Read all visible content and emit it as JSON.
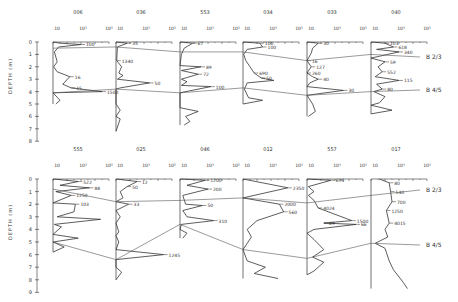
{
  "chart_data": {
    "type": "line",
    "title": "",
    "ylabel": "DEPTH (m)",
    "xlabel": "",
    "x_scale": "log",
    "x_ticks": [
      "10",
      "10³",
      "10⁵"
    ],
    "boundaries": [
      {
        "name": "B 2/3"
      },
      {
        "name": "B 4/5"
      }
    ],
    "rows": [
      {
        "ylim": [
          0,
          8
        ],
        "y_ticks": [
          "0",
          "1",
          "2",
          "3",
          "4",
          "5",
          "6",
          "7",
          "8"
        ],
        "panels": [
          {
            "id": "006",
            "annotations": [
              "100",
              "16",
              "15",
              "1500"
            ],
            "profile": [
              [
                0,
                0.0
              ],
              [
                0.5,
                0.1
              ],
              [
                2,
                0.2
              ],
              [
                0.4,
                0.4
              ],
              [
                0.1,
                0.8
              ],
              [
                0.3,
                1.6
              ],
              [
                0.05,
                2.0
              ],
              [
                0.3,
                2.4
              ],
              [
                1.2,
                2.8
              ],
              [
                0.7,
                3.4
              ],
              [
                1.3,
                3.7
              ],
              [
                3.5,
                4.0
              ],
              [
                0.0,
                4.1
              ],
              [
                0.5,
                4.7
              ],
              [
                0.2,
                5.0
              ]
            ],
            "b23_depth": 0.5,
            "b45_depth": 4.1
          },
          {
            "id": "036",
            "annotations": [
              "35",
              "50",
              "1340"
            ],
            "profile": [
              [
                0,
                0.0
              ],
              [
                0.8,
                0.1
              ],
              [
                0.1,
                0.4
              ],
              [
                0.05,
                1.5
              ],
              [
                0.4,
                2.0
              ],
              [
                0.2,
                2.5
              ],
              [
                0.5,
                2.7
              ],
              [
                0.1,
                3.0
              ],
              [
                2.4,
                3.3
              ],
              [
                0.3,
                3.7
              ],
              [
                0.0,
                3.8
              ],
              [
                0.0,
                5.0
              ],
              [
                0.3,
                5.5
              ],
              [
                0.0,
                6.0
              ],
              [
                0.3,
                6.2
              ],
              [
                0.0,
                7.2
              ]
            ],
            "b23_depth": 0.4,
            "b45_depth": 3.8
          },
          {
            "id": "553",
            "annotations": [
              "67",
              "89",
              "72",
              "100"
            ],
            "profile": [
              [
                0,
                0.0
              ],
              [
                0.9,
                0.1
              ],
              [
                0.3,
                0.5
              ],
              [
                0.1,
                1.0
              ],
              [
                0.0,
                1.9
              ],
              [
                1.5,
                2.0
              ],
              [
                0.1,
                2.3
              ],
              [
                1.3,
                2.6
              ],
              [
                0.1,
                3.0
              ],
              [
                0.5,
                3.2
              ],
              [
                0.1,
                3.5
              ],
              [
                2.2,
                3.6
              ],
              [
                0.0,
                4.1
              ],
              [
                0.0,
                5.3
              ],
              [
                1.3,
                5.6
              ],
              [
                0.4,
                6.0
              ],
              [
                0.7,
                6.4
              ],
              [
                0.3,
                6.7
              ]
            ],
            "b23_depth": 0.8,
            "b45_depth": 4.1
          },
          {
            "id": "034",
            "annotations": [
              "100",
              "100",
              "690",
              "50"
            ],
            "profile": [
              [
                0,
                0.0
              ],
              [
                1.2,
                0.1
              ],
              [
                1.4,
                0.4
              ],
              [
                0.3,
                0.6
              ],
              [
                0.05,
                1.0
              ],
              [
                0.2,
                1.5
              ],
              [
                0.5,
                2.0
              ],
              [
                0.8,
                2.5
              ],
              [
                1.3,
                2.9
              ],
              [
                2.2,
                3.1
              ],
              [
                0.3,
                3.3
              ],
              [
                0.1,
                3.8
              ],
              [
                0.4,
                4.5
              ],
              [
                1.4,
                4.7
              ],
              [
                0.0,
                5.0
              ]
            ],
            "b23_depth": 0.8,
            "b45_depth": 3.7
          },
          {
            "id": "033",
            "annotations": [
              "30",
              "40",
              "30",
              "16",
              "127",
              "260"
            ],
            "profile": [
              [
                0,
                0.0
              ],
              [
                0.8,
                0.1
              ],
              [
                0.4,
                0.5
              ],
              [
                0.3,
                0.9
              ],
              [
                0.0,
                1.5
              ],
              [
                0.3,
                2.0
              ],
              [
                0.0,
                2.5
              ],
              [
                0.4,
                2.8
              ],
              [
                0.8,
                3.0
              ],
              [
                0.2,
                3.3
              ],
              [
                0.0,
                3.6
              ],
              [
                2.6,
                3.9
              ],
              [
                0.0,
                4.3
              ],
              [
                0.4,
                5.0
              ],
              [
                0.6,
                5.6
              ],
              [
                0.1,
                6.0
              ]
            ],
            "b23_depth": 1.5,
            "b45_depth": 4.3
          },
          {
            "id": "040",
            "annotations": [
              "103",
              "618",
              "340",
              "59",
              "552",
              "115",
              "80"
            ],
            "profile": [
              [
                0,
                0.0
              ],
              [
                1.0,
                0.1
              ],
              [
                1.6,
                0.4
              ],
              [
                0.4,
                0.6
              ],
              [
                2.0,
                0.8
              ],
              [
                0.0,
                1.3
              ],
              [
                1.0,
                1.6
              ],
              [
                0.5,
                2.0
              ],
              [
                0.8,
                2.4
              ],
              [
                0.3,
                2.8
              ],
              [
                2.0,
                3.1
              ],
              [
                0.4,
                3.4
              ],
              [
                0.8,
                3.8
              ],
              [
                0.2,
                4.0
              ],
              [
                1.0,
                4.4
              ],
              [
                0.6,
                4.9
              ],
              [
                0.0,
                5.1
              ],
              [
                1.5,
                5.5
              ],
              [
                0.0,
                5.8
              ]
            ],
            "b23_depth": 1.0,
            "b45_depth": 4.0
          }
        ]
      },
      {
        "ylim": [
          0,
          9
        ],
        "y_ticks": [
          "0",
          "1",
          "2",
          "3",
          "4",
          "5",
          "6",
          "7",
          "8",
          "9"
        ],
        "panels": [
          {
            "id": "555",
            "annotations": [
              "522",
              "88",
              "1250",
              "103"
            ],
            "profile": [
              [
                0,
                0.0
              ],
              [
                1.8,
                0.2
              ],
              [
                0.5,
                0.5
              ],
              [
                2.6,
                0.7
              ],
              [
                0.2,
                1.0
              ],
              [
                1.3,
                1.3
              ],
              [
                0.0,
                1.9
              ],
              [
                1.6,
                2.0
              ],
              [
                1.5,
                2.6
              ],
              [
                0.3,
                3.0
              ],
              [
                3.4,
                3.2
              ],
              [
                0.1,
                3.6
              ],
              [
                0.6,
                3.8
              ],
              [
                0.0,
                4.4
              ],
              [
                1.8,
                4.7
              ],
              [
                0.0,
                5.0
              ],
              [
                0.8,
                5.4
              ],
              [
                0.0,
                5.8
              ]
            ],
            "b23_depth": 0.8,
            "b45_depth": 5.0
          },
          {
            "id": "025",
            "annotations": [
              "12",
              "50",
              "33",
              "1245"
            ],
            "profile": [
              [
                0,
                0.0
              ],
              [
                1.5,
                0.2
              ],
              [
                0.8,
                0.6
              ],
              [
                0.3,
                1.0
              ],
              [
                0.5,
                1.5
              ],
              [
                0.0,
                1.8
              ],
              [
                0.9,
                2.0
              ],
              [
                0.0,
                2.5
              ],
              [
                0.3,
                3.0
              ],
              [
                0.0,
                3.5
              ],
              [
                0.2,
                4.2
              ],
              [
                0.0,
                4.5
              ],
              [
                0.2,
                5.0
              ],
              [
                0.0,
                5.6
              ],
              [
                3.4,
                6.0
              ],
              [
                0.0,
                6.4
              ],
              [
                0.0,
                7.0
              ],
              [
                0.4,
                7.4
              ],
              [
                0.0,
                8.0
              ]
            ],
            "b23_depth": 1.8,
            "b45_depth": 6.4
          },
          {
            "id": "046",
            "annotations": [
              "1200",
              "200",
              "50",
              "310"
            ],
            "profile": [
              [
                0,
                0.0
              ],
              [
                1.8,
                0.1
              ],
              [
                0.5,
                0.5
              ],
              [
                2.0,
                0.8
              ],
              [
                0.2,
                1.3
              ],
              [
                0.4,
                2.0
              ],
              [
                1.6,
                2.1
              ],
              [
                0.2,
                2.5
              ],
              [
                0.5,
                3.0
              ],
              [
                2.4,
                3.3
              ],
              [
                0.1,
                3.6
              ],
              [
                0.0,
                4.0
              ],
              [
                0.5,
                4.3
              ],
              [
                0.2,
                4.7
              ]
            ],
            "b23_depth": 1.7,
            "b45_depth": 3.6
          },
          {
            "id": "012",
            "annotations": [
              "2350",
              "2000",
              "560"
            ],
            "profile": [
              [
                0,
                0.0
              ],
              [
                3.2,
                0.7
              ],
              [
                0.0,
                1.5
              ],
              [
                2.6,
                2.0
              ],
              [
                2.9,
                2.6
              ],
              [
                1.0,
                3.3
              ],
              [
                0.3,
                4.0
              ],
              [
                0.6,
                4.6
              ],
              [
                0.0,
                5.6
              ],
              [
                0.3,
                6.5
              ],
              [
                1.6,
                7.0
              ],
              [
                0.8,
                7.5
              ],
              [
                2.5,
                7.9
              ]
            ],
            "b23_depth": 1.5,
            "b45_depth": 5.6
          },
          {
            "id": "557",
            "annotations": [
              "694",
              "4024",
              "1500",
              "69",
              "66"
            ],
            "profile": [
              [
                0,
                0.0
              ],
              [
                1.7,
                0.1
              ],
              [
                0.1,
                0.6
              ],
              [
                0.5,
                1.0
              ],
              [
                0.1,
                1.3
              ],
              [
                0.5,
                1.7
              ],
              [
                0.8,
                2.3
              ],
              [
                3.2,
                3.3
              ],
              [
                1.2,
                3.5
              ],
              [
                3.5,
                3.6
              ],
              [
                0.5,
                4.0
              ],
              [
                0.0,
                4.3
              ],
              [
                0.5,
                4.8
              ],
              [
                1.2,
                5.6
              ],
              [
                0.4,
                6.2
              ],
              [
                1.2,
                6.6
              ],
              [
                0.5,
                7.3
              ],
              [
                0.0,
                7.6
              ]
            ],
            "b23_depth": 1.9,
            "b45_depth": 6.3
          },
          {
            "id": "017",
            "annotations": [
              "80",
              "540",
              "700",
              "1250",
              "4015"
            ],
            "profile": [
              [
                0.6,
                0.0
              ],
              [
                1.3,
                0.3
              ],
              [
                1.4,
                1.0
              ],
              [
                1.5,
                1.8
              ],
              [
                1.1,
                2.5
              ],
              [
                1.3,
                3.5
              ],
              [
                1.0,
                4.0
              ],
              [
                1.2,
                4.6
              ],
              [
                0.3,
                5.1
              ],
              [
                1.0,
                5.5
              ],
              [
                1.3,
                6.5
              ],
              [
                1.6,
                7.2
              ],
              [
                2.3,
                8.2
              ],
              [
                2.6,
                8.7
              ]
            ],
            "b23_depth": 1.3,
            "b45_depth": 5.1
          }
        ]
      }
    ],
    "grid": false,
    "legend": "none"
  }
}
